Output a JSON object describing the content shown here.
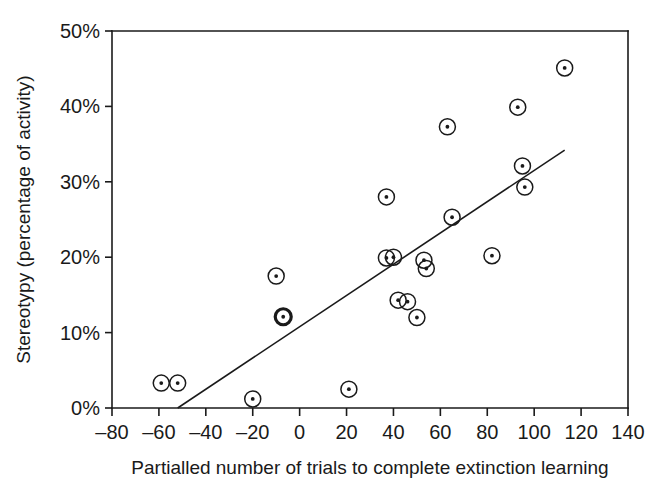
{
  "chart_data": {
    "type": "scatter",
    "title": "",
    "xlabel": "Partialled number of trials to complete extinction learning",
    "ylabel": "Stereotypy (percentage of activity)",
    "xlim": [
      -80,
      140
    ],
    "ylim": [
      0,
      50
    ],
    "xticks": [
      -80,
      -60,
      -40,
      -20,
      0,
      20,
      40,
      60,
      80,
      100,
      120,
      140
    ],
    "xtick_labels": [
      "–80",
      "–60",
      "–40",
      "–20",
      "0",
      "20",
      "40",
      "60",
      "80",
      "100",
      "120",
      "140"
    ],
    "yticks": [
      0,
      10,
      20,
      30,
      40,
      50
    ],
    "ytick_labels": [
      "0%",
      "10%",
      "20%",
      "30%",
      "40%",
      "50%"
    ],
    "grid": false,
    "legend": null,
    "marker_style": "open-circle-with-center-dot",
    "points": [
      {
        "x": -59,
        "y": 3.3,
        "emphasis": "normal"
      },
      {
        "x": -52,
        "y": 3.3,
        "emphasis": "normal"
      },
      {
        "x": -20,
        "y": 1.2,
        "emphasis": "normal"
      },
      {
        "x": -10,
        "y": 17.5,
        "emphasis": "normal"
      },
      {
        "x": -7,
        "y": 12.1,
        "emphasis": "bold"
      },
      {
        "x": 21,
        "y": 2.5,
        "emphasis": "normal"
      },
      {
        "x": 37,
        "y": 28.0,
        "emphasis": "normal"
      },
      {
        "x": 37,
        "y": 19.9,
        "emphasis": "normal"
      },
      {
        "x": 40,
        "y": 20.0,
        "emphasis": "normal"
      },
      {
        "x": 42,
        "y": 14.3,
        "emphasis": "normal"
      },
      {
        "x": 46,
        "y": 14.1,
        "emphasis": "normal"
      },
      {
        "x": 50,
        "y": 12.0,
        "emphasis": "normal"
      },
      {
        "x": 53,
        "y": 19.6,
        "emphasis": "normal"
      },
      {
        "x": 54,
        "y": 18.5,
        "emphasis": "normal"
      },
      {
        "x": 63,
        "y": 37.3,
        "emphasis": "normal"
      },
      {
        "x": 65,
        "y": 25.3,
        "emphasis": "normal"
      },
      {
        "x": 82,
        "y": 20.2,
        "emphasis": "normal"
      },
      {
        "x": 93,
        "y": 39.9,
        "emphasis": "normal"
      },
      {
        "x": 95,
        "y": 32.1,
        "emphasis": "normal"
      },
      {
        "x": 96,
        "y": 29.3,
        "emphasis": "normal"
      },
      {
        "x": 113,
        "y": 45.1,
        "emphasis": "normal"
      }
    ],
    "trend_line": {
      "x_start": -52,
      "y_start": 0.0,
      "x_end": 113,
      "y_end": 34.2
    }
  }
}
